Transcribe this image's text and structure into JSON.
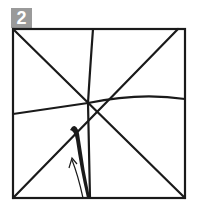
{
  "step": {
    "number": "2",
    "badge_color": "#9a9a9a"
  },
  "diagram": {
    "line_color": "#1a1a1a"
  }
}
